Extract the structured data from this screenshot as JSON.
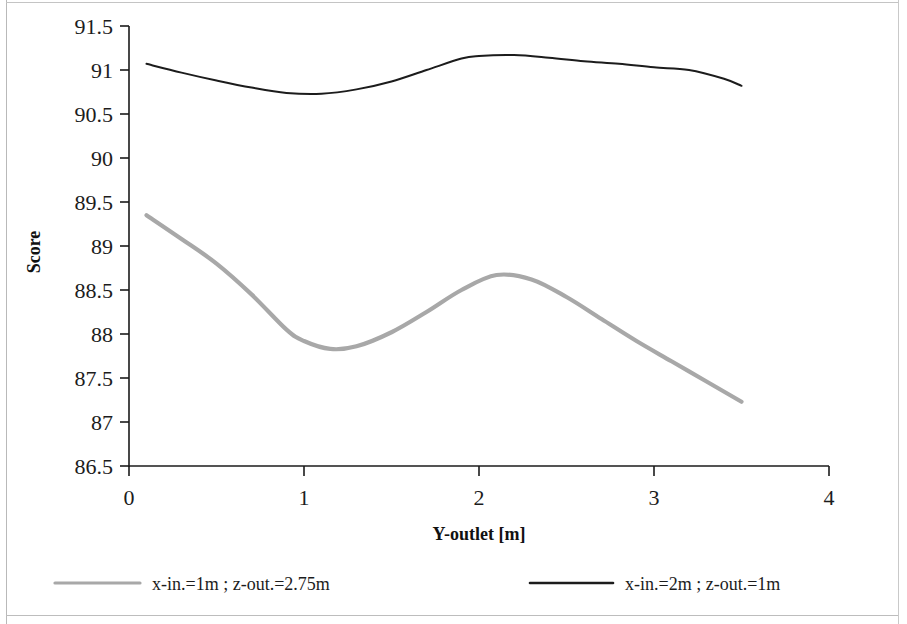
{
  "chart_data": {
    "type": "line",
    "title": "",
    "xlabel": "Y-outlet [m]",
    "ylabel": "Score",
    "xlim": [
      0,
      4
    ],
    "ylim": [
      86.5,
      91.5
    ],
    "xticks": [
      "0",
      "1",
      "2",
      "3",
      "4"
    ],
    "xtick_values": [
      0,
      1,
      2,
      3,
      4
    ],
    "yticks": [
      "86.5",
      "87",
      "87.5",
      "88",
      "88.5",
      "89",
      "89.5",
      "90",
      "90.5",
      "91",
      "91.5"
    ],
    "ytick_values": [
      86.5,
      87,
      87.5,
      88,
      88.5,
      89,
      89.5,
      90,
      90.5,
      91,
      91.5
    ],
    "grid": false,
    "legend_position": "bottom",
    "series": [
      {
        "name": "x-in.=1m ;    z-out.=2.75m",
        "color": "#a8a8a8",
        "width": 4.2,
        "x": [
          0.1,
          0.3,
          0.5,
          0.7,
          0.9,
          1.0,
          1.15,
          1.3,
          1.5,
          1.7,
          1.9,
          2.1,
          2.3,
          2.5,
          2.7,
          2.9,
          3.1,
          3.3,
          3.5
        ],
        "values": [
          89.35,
          89.08,
          88.8,
          88.45,
          88.05,
          87.92,
          87.83,
          87.86,
          88.02,
          88.25,
          88.5,
          88.67,
          88.62,
          88.42,
          88.17,
          87.92,
          87.69,
          87.46,
          87.23
        ]
      },
      {
        "name": "x-in.=2m ;    z-out.=1m",
        "color": "#1c1c1c",
        "width": 2.0,
        "x": [
          0.1,
          0.3,
          0.5,
          0.7,
          0.9,
          1.1,
          1.3,
          1.5,
          1.7,
          1.9,
          2.0,
          2.2,
          2.4,
          2.6,
          2.8,
          3.0,
          3.2,
          3.4,
          3.5
        ],
        "values": [
          91.07,
          90.97,
          90.88,
          90.8,
          90.74,
          90.73,
          90.78,
          90.87,
          91.0,
          91.13,
          91.16,
          91.17,
          91.14,
          91.1,
          91.07,
          91.03,
          91.0,
          90.9,
          90.82
        ]
      }
    ]
  },
  "legend": {
    "entries": [
      {
        "label": "x-in.=1m ;    z-out.=2.75m",
        "color": "#a8a8a8"
      },
      {
        "label": "x-in.=2m ;    z-out.=1m",
        "color": "#1c1c1c"
      }
    ]
  },
  "axes": {
    "y_title": "Score",
    "x_title": "Y-outlet [m]"
  }
}
